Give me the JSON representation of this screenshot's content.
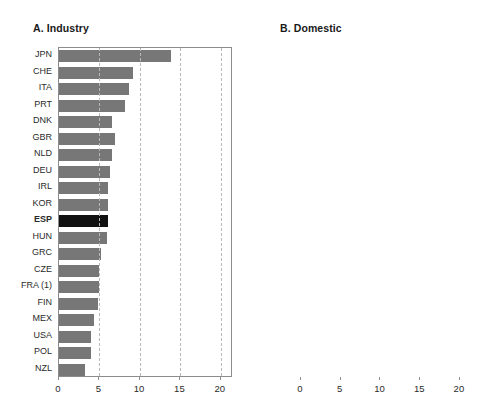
{
  "figure": {
    "width": 500,
    "height": 412,
    "colors": {
      "price_excluding_tax": "#777777",
      "taxes": "#e2e2e2",
      "highlight_country": "#111111",
      "frame": "#8c8c8c",
      "gridline": "#b9b9b9"
    }
  },
  "panels": [
    {
      "id": "panel-a",
      "title": "A. Industry",
      "axis": {
        "ticks": [
          "0",
          "5",
          "10",
          "15",
          "20"
        ],
        "min": 0,
        "max": 21.5,
        "grid": true
      },
      "highlight": "ESP",
      "legend": null
    },
    {
      "id": "panel-b",
      "title": "B. Domestic",
      "axis": {
        "ticks": [
          "0",
          "5",
          "10",
          "15",
          "20"
        ],
        "min": 0,
        "max": 21.9,
        "grid": true
      },
      "highlight": "ESP",
      "legend": {
        "items": [
          {
            "label": "Price excluding tax",
            "color": "#777777",
            "name": "legend-price-excluding-tax"
          },
          {
            "label": "Taxes",
            "color": "#e2e2e2",
            "name": "legend-taxes"
          }
        ]
      }
    }
  ],
  "chart_data": [
    {
      "type": "bar",
      "orientation": "horizontal",
      "title": "A. Industry",
      "xlabel": "",
      "ylabel": "",
      "xlim": [
        0,
        21.5
      ],
      "xticks": [
        0,
        5,
        10,
        15,
        20
      ],
      "grid": true,
      "legend_position": "none",
      "highlight": "ESP",
      "categories": [
        "JPN",
        "CHE",
        "ITA",
        "PRT",
        "DNK",
        "GBR",
        "NLD",
        "DEU",
        "IRL",
        "KOR",
        "ESP",
        "HUN",
        "GRC",
        "CZE",
        "FRA (1)",
        "FIN",
        "MEX",
        "USA",
        "POL",
        "NZL"
      ],
      "series": [
        {
          "name": "Price excluding tax",
          "values": [
            13.9,
            9.2,
            8.7,
            8.1,
            6.6,
            6.9,
            6.6,
            6.3,
            6.0,
            6.0,
            6.0,
            5.9,
            5.2,
            5.0,
            5.0,
            4.8,
            4.3,
            4.0,
            3.9,
            3.2
          ]
        }
      ]
    },
    {
      "type": "bar",
      "orientation": "horizontal",
      "stacked": true,
      "title": "B. Domestic",
      "xlabel": "",
      "ylabel": "",
      "xlim": [
        0,
        21.9
      ],
      "xticks": [
        0,
        5,
        10,
        15,
        20
      ],
      "grid": true,
      "legend_position": "inside-lower-right",
      "highlight": "ESP",
      "categories": [
        "JPN",
        "DNK",
        "DEU",
        "ITA",
        "ESP",
        "PRT",
        "NLD",
        "CHE",
        "FRA (1)",
        "GBR",
        "IRL",
        "FIN",
        "GRC",
        "USA",
        "HUN",
        "NZL",
        "POL",
        "NOR",
        "MEX",
        "CZE"
      ],
      "series": [
        {
          "name": "Price excluding tax",
          "values": [
            20.0,
            8.2,
            13.2,
            11.1,
            12.2,
            14.0,
            9.4,
            12.3,
            10.1,
            11.2,
            10.7,
            6.7,
            8.5,
            8.4,
            6.4,
            6.5,
            5.7,
            4.4,
            5.3,
            4.5
          ]
        },
        {
          "name": "Taxes",
          "values": [
            0.8,
            11.8,
            2.1,
            3.6,
            2.3,
            0.7,
            4.2,
            0.9,
            3.0,
            0.5,
            1.2,
            2.7,
            0.5,
            0.0,
            0.9,
            0.7,
            1.3,
            1.9,
            1.4,
            0.8
          ]
        }
      ],
      "totals": [
        20.8,
        20.0,
        15.3,
        14.7,
        14.5,
        14.7,
        13.6,
        13.2,
        13.1,
        11.7,
        11.9,
        9.4,
        9.0,
        8.4,
        7.3,
        7.2,
        7.0,
        6.3,
        6.7,
        5.3
      ]
    }
  ]
}
